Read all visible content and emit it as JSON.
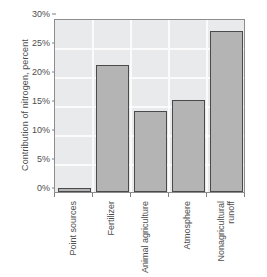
{
  "chart_data": {
    "type": "bar",
    "title": "",
    "subtitle": "",
    "xlabel": "",
    "ylabel": "Contribution of nitrogen, percent",
    "categories": [
      "Point sources",
      "Fertilizer",
      "Animal agriculture",
      "Atmosphere",
      "Nonagricultural runoff"
    ],
    "values": [
      0.7,
      21.9,
      14.0,
      15.9,
      27.7
    ],
    "ylim": [
      0,
      30
    ],
    "yticks": [
      0,
      5,
      10,
      15,
      20,
      25,
      30
    ],
    "ytick_labels": [
      "0%",
      "5%",
      "10%",
      "15%",
      "20%",
      "25%",
      "30%"
    ],
    "grid": true,
    "legend": "none",
    "orientation": "vertical",
    "bar_fill_color": "#b4b4b4",
    "bar_edge_color": "#4a4a4a",
    "plot_background_color": "#e9eaec",
    "gridline_color": "#fbfbfc",
    "axis_color": "#8d8d8d",
    "text_color": "#4d4d4d",
    "page_background_color": "#ffffff"
  },
  "axis": {
    "y_title": "Contribution of nitrogen, percent"
  }
}
